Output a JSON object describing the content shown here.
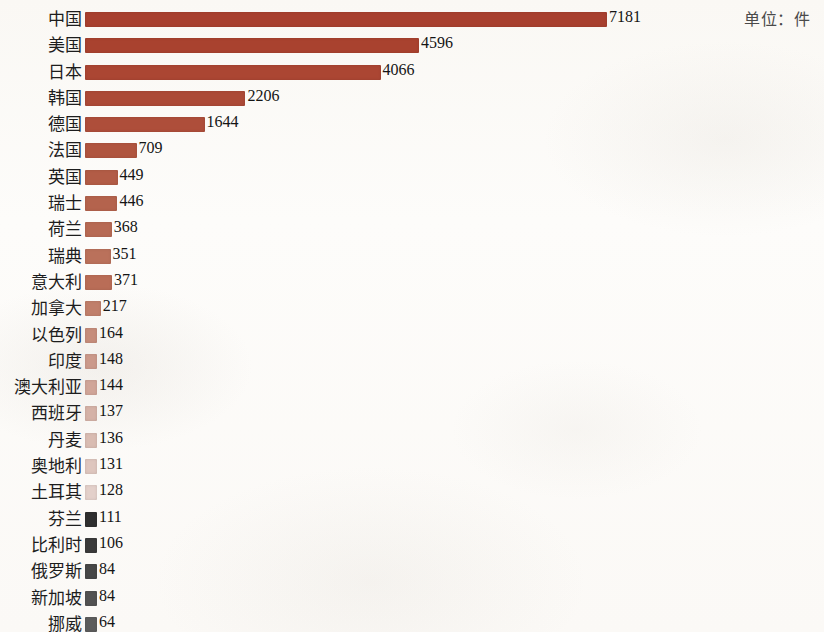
{
  "unit_caption": "单位：件",
  "chart_data": {
    "type": "bar",
    "orientation": "horizontal",
    "title": "",
    "subtitle": "",
    "xlabel": "",
    "ylabel": "",
    "unit_label": "单位：件",
    "grid": false,
    "legend": "none",
    "axis_visible": false,
    "value_labels": true,
    "xlim": [
      0,
      7181
    ],
    "categories": [
      "中国",
      "美国",
      "日本",
      "韩国",
      "德国",
      "法国",
      "英国",
      "瑞士",
      "荷兰",
      "瑞典",
      "意大利",
      "加拿大",
      "以色列",
      "印度",
      "澳大利亚",
      "西班牙",
      "丹麦",
      "奥地利",
      "土耳其",
      "芬兰",
      "比利时",
      "俄罗斯",
      "新加坡",
      "挪威"
    ],
    "values": [
      7181,
      4596,
      4066,
      2206,
      1644,
      709,
      449,
      446,
      368,
      351,
      371,
      217,
      164,
      148,
      144,
      137,
      136,
      131,
      128,
      111,
      106,
      84,
      84,
      64
    ],
    "bar_colors": [
      "#a8402f",
      "#a9422f",
      "#ab4633",
      "#ac4a37",
      "#ae4e3a",
      "#b0553f",
      "#b25c46",
      "#b4634d",
      "#b76a54",
      "#ba715b",
      "#b96d57",
      "#c07f6b",
      "#c68d7b",
      "#cb998a",
      "#d0a598",
      "#d5b2a7",
      "#d9bcb2",
      "#dec6be",
      "#e3d0ca",
      "#2f2f2f",
      "#3a3a3a",
      "#474747",
      "#525252",
      "#5c5c5c"
    ],
    "rows": [
      {
        "label": "中国",
        "value": 7181,
        "color": "#a8402f"
      },
      {
        "label": "美国",
        "value": 4596,
        "color": "#a9422f"
      },
      {
        "label": "日本",
        "value": 4066,
        "color": "#ab4633"
      },
      {
        "label": "韩国",
        "value": 2206,
        "color": "#ac4a37"
      },
      {
        "label": "德国",
        "value": 1644,
        "color": "#ae4e3a"
      },
      {
        "label": "法国",
        "value": 709,
        "color": "#b0553f"
      },
      {
        "label": "英国",
        "value": 449,
        "color": "#b25c46"
      },
      {
        "label": "瑞士",
        "value": 446,
        "color": "#b4634d"
      },
      {
        "label": "荷兰",
        "value": 368,
        "color": "#b76a54"
      },
      {
        "label": "瑞典",
        "value": 351,
        "color": "#ba715b"
      },
      {
        "label": "意大利",
        "value": 371,
        "color": "#b96d57"
      },
      {
        "label": "加拿大",
        "value": 217,
        "color": "#c07f6b"
      },
      {
        "label": "以色列",
        "value": 164,
        "color": "#c68d7b"
      },
      {
        "label": "印度",
        "value": 148,
        "color": "#cb998a"
      },
      {
        "label": "澳大利亚",
        "value": 144,
        "color": "#d0a598"
      },
      {
        "label": "西班牙",
        "value": 137,
        "color": "#d5b2a7"
      },
      {
        "label": "丹麦",
        "value": 136,
        "color": "#d9bcb2"
      },
      {
        "label": "奥地利",
        "value": 131,
        "color": "#dec6be"
      },
      {
        "label": "土耳其",
        "value": 128,
        "color": "#e3d0ca"
      },
      {
        "label": "芬兰",
        "value": 111,
        "color": "#2f2f2f"
      },
      {
        "label": "比利时",
        "value": 106,
        "color": "#3a3a3a"
      },
      {
        "label": "俄罗斯",
        "value": 84,
        "color": "#474747"
      },
      {
        "label": "新加坡",
        "value": 84,
        "color": "#525252"
      },
      {
        "label": "挪威",
        "value": 64,
        "color": "#5c5c5c"
      }
    ]
  }
}
